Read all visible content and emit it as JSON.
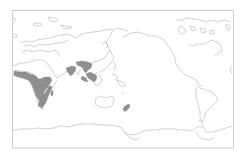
{
  "map": {
    "projection": "pacific-centered world map",
    "frame_color": "#c4c4c4",
    "coastline_color": "#b4b4b4",
    "range_fill_color": "#8f8f8f",
    "background": "#ffffff",
    "shaded_regions": [
      "west-central-africa",
      "east-southern-africa",
      "madagascar",
      "india",
      "southeast-asia",
      "maritime-southeast-asia",
      "new-zealand"
    ]
  }
}
